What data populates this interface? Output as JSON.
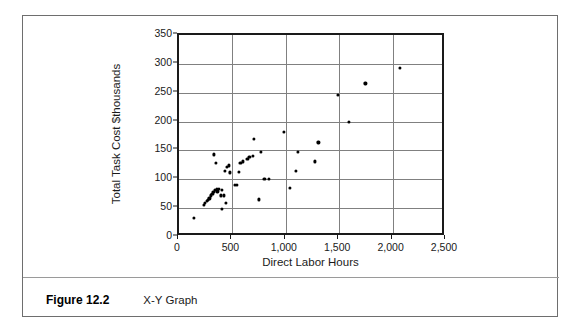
{
  "figure": {
    "label": "Figure 12.2",
    "caption": "X-Y Graph"
  },
  "chart_data": {
    "type": "scatter",
    "title": "",
    "xlabel": "Direct Labor Hours",
    "ylabel": "Total Task Cost $thousands",
    "xlim": [
      0,
      2500
    ],
    "ylim": [
      0,
      350
    ],
    "xticks": [
      0,
      500,
      1000,
      1500,
      2000,
      2500
    ],
    "xtick_labels": [
      "0",
      "500",
      "1,000",
      "1,500",
      "2,000",
      "2,500"
    ],
    "yticks": [
      0,
      50,
      100,
      150,
      200,
      250,
      300,
      350
    ],
    "ytick_labels": [
      "0",
      "50",
      "100",
      "150",
      "200",
      "250",
      "300",
      "350"
    ],
    "grid": true,
    "grid_axis": "both",
    "legend": false,
    "marker": "diamond",
    "marker_color": "#000000",
    "points": [
      [
        140,
        33
      ],
      [
        230,
        56
      ],
      [
        245,
        59
      ],
      [
        258,
        62
      ],
      [
        272,
        64
      ],
      [
        285,
        67
      ],
      [
        300,
        72
      ],
      [
        312,
        75
      ],
      [
        322,
        78
      ],
      [
        330,
        143
      ],
      [
        335,
        81
      ],
      [
        345,
        128
      ],
      [
        352,
        83
      ],
      [
        360,
        79
      ],
      [
        372,
        84
      ],
      [
        392,
        72
      ],
      [
        400,
        81
      ],
      [
        405,
        49
      ],
      [
        420,
        72
      ],
      [
        432,
        115
      ],
      [
        440,
        59
      ],
      [
        452,
        121
      ],
      [
        470,
        124
      ],
      [
        480,
        112
      ],
      [
        520,
        90
      ],
      [
        545,
        90
      ],
      [
        560,
        113
      ],
      [
        575,
        129
      ],
      [
        600,
        131
      ],
      [
        640,
        136
      ],
      [
        660,
        139
      ],
      [
        690,
        141
      ],
      [
        700,
        170
      ],
      [
        745,
        65
      ],
      [
        770,
        147
      ],
      [
        800,
        101
      ],
      [
        840,
        100
      ],
      [
        980,
        182
      ],
      [
        1040,
        85
      ],
      [
        1095,
        114
      ],
      [
        1110,
        147
      ],
      [
        1270,
        131
      ],
      [
        1305,
        164
      ],
      [
        1490,
        246
      ],
      [
        1590,
        199
      ],
      [
        1745,
        266
      ],
      [
        2065,
        293
      ]
    ]
  }
}
